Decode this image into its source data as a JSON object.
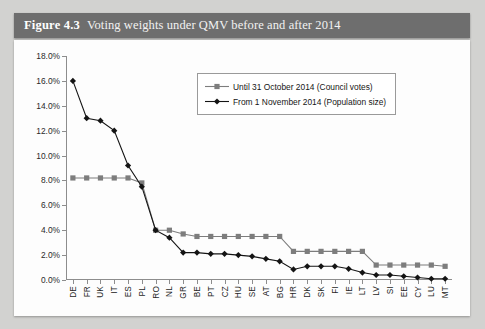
{
  "header": {
    "figure_number": "Figure 4.3",
    "title": "Voting weights under QMV before and after 2014",
    "bar_color": "#6e6e6e"
  },
  "legend": {
    "position": "top-center",
    "entries": [
      {
        "label": "Until 31 October 2014 (Council votes)",
        "marker": "square",
        "color": "#7d7d7d"
      },
      {
        "label": "From 1 November 2014 (Population size)",
        "marker": "diamond",
        "color": "#141414"
      }
    ]
  },
  "axis": {
    "y_ticks": [
      "18.0%",
      "16.0%",
      "14.0%",
      "12.0%",
      "10.0%",
      "8.0%",
      "6.0%",
      "4.0%",
      "2.0%",
      "0.0%"
    ]
  },
  "chart_data": {
    "type": "line",
    "title": "Voting weights under QMV before and after 2014",
    "xlabel": "",
    "ylabel": "",
    "ylim": [
      0,
      18
    ],
    "y_tick_step": 2,
    "y_tick_format": "percent",
    "grid": false,
    "legend_position": "top-center",
    "categories": [
      "DE",
      "FR",
      "UK",
      "IT",
      "ES",
      "PL",
      "RO",
      "NL",
      "GR",
      "BE",
      "PT",
      "CZ",
      "HU",
      "SE",
      "AT",
      "BG",
      "HR",
      "DK",
      "SK",
      "FI",
      "IE",
      "LT",
      "LV",
      "SI",
      "EE",
      "CY",
      "LU",
      "MT"
    ],
    "series": [
      {
        "name": "Until 31 October 2014 (Council votes)",
        "marker": "square",
        "color": "#7d7d7d",
        "values": [
          8.2,
          8.2,
          8.2,
          8.2,
          8.2,
          7.8,
          4.0,
          4.0,
          3.7,
          3.5,
          3.5,
          3.5,
          3.5,
          3.5,
          3.5,
          3.5,
          2.3,
          2.3,
          2.3,
          2.3,
          2.3,
          2.3,
          1.2,
          1.2,
          1.2,
          1.2,
          1.2,
          1.1
        ]
      },
      {
        "name": "From 1 November 2014 (Population size)",
        "marker": "diamond",
        "color": "#141414",
        "values": [
          16.0,
          13.0,
          12.8,
          12.0,
          9.2,
          7.5,
          4.0,
          3.4,
          2.2,
          2.2,
          2.1,
          2.1,
          2.0,
          1.9,
          1.7,
          1.5,
          0.85,
          1.1,
          1.1,
          1.1,
          0.9,
          0.6,
          0.4,
          0.4,
          0.3,
          0.2,
          0.1,
          0.1
        ]
      }
    ]
  }
}
